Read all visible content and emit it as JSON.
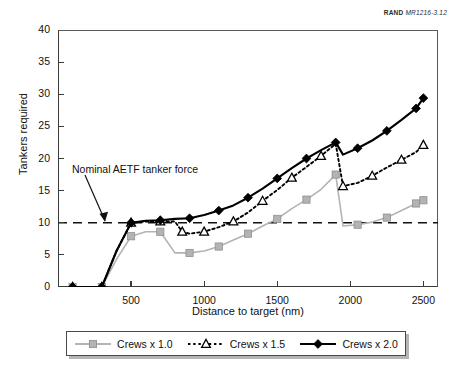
{
  "credit": {
    "rand": "RAND",
    "code": "MR1216-3.12"
  },
  "axes": {
    "ylabel": "Tankers required",
    "xlabel": "Distance to target (nm)",
    "yticks": [
      0,
      5,
      10,
      15,
      20,
      25,
      30,
      35,
      40
    ],
    "xticks": [
      500,
      1000,
      1500,
      2000,
      2500
    ]
  },
  "annotation": {
    "text": "Nominal AETF tanker force"
  },
  "legend": {
    "items": [
      {
        "label": "Crews x 1.0",
        "color": "#b3b3b3",
        "marker": "square",
        "style": "solid"
      },
      {
        "label": "Crews x 1.5",
        "color": "#000000",
        "marker": "triangle",
        "style": "dotted"
      },
      {
        "label": "Crews x 2.0",
        "color": "#000000",
        "marker": "diamond",
        "style": "solid"
      }
    ]
  },
  "chart_data": {
    "type": "line",
    "title": "",
    "xlabel": "Distance to target (nm)",
    "ylabel": "Tankers required",
    "xlim": [
      0,
      2600
    ],
    "ylim": [
      0,
      40
    ],
    "grid": false,
    "legend_position": "below",
    "reference_line": {
      "value": 10,
      "style": "dashed",
      "label": "Nominal AETF tanker force"
    },
    "series": [
      {
        "name": "Crews x 1.0",
        "color": "#b3b3b3",
        "marker": "square",
        "style": "solid",
        "points": [
          [
            100,
            0
          ],
          [
            200,
            0
          ],
          [
            300,
            0
          ],
          [
            400,
            4.3
          ],
          [
            500,
            7.9
          ],
          [
            600,
            8.6
          ],
          [
            700,
            8.6
          ],
          [
            800,
            5.3
          ],
          [
            900,
            5.3
          ],
          [
            1000,
            5.6
          ],
          [
            1100,
            6.3
          ],
          [
            1200,
            7.3
          ],
          [
            1300,
            8.3
          ],
          [
            1400,
            9.5
          ],
          [
            1500,
            10.6
          ],
          [
            1600,
            12.2
          ],
          [
            1700,
            13.6
          ],
          [
            1800,
            15.2
          ],
          [
            1900,
            17.5
          ],
          [
            1950,
            9.5
          ],
          [
            2050,
            9.7
          ],
          [
            2150,
            10.1
          ],
          [
            2250,
            10.8
          ],
          [
            2350,
            11.9
          ],
          [
            2450,
            13.0
          ],
          [
            2500,
            13.5
          ]
        ]
      },
      {
        "name": "Crews x 1.5",
        "color": "#000000",
        "marker": "triangle",
        "style": "dotted",
        "points": [
          [
            100,
            0
          ],
          [
            200,
            0
          ],
          [
            300,
            0
          ],
          [
            400,
            5.6
          ],
          [
            500,
            10.0
          ],
          [
            600,
            10.2
          ],
          [
            700,
            10.2
          ],
          [
            800,
            10.2
          ],
          [
            850,
            8.6
          ],
          [
            900,
            8.3
          ],
          [
            1000,
            8.6
          ],
          [
            1100,
            9.3
          ],
          [
            1200,
            10.2
          ],
          [
            1300,
            11.6
          ],
          [
            1400,
            13.4
          ],
          [
            1500,
            15.1
          ],
          [
            1600,
            17.0
          ],
          [
            1700,
            18.7
          ],
          [
            1800,
            20.4
          ],
          [
            1900,
            22.3
          ],
          [
            1950,
            15.7
          ],
          [
            2050,
            16.2
          ],
          [
            2150,
            17.3
          ],
          [
            2250,
            18.6
          ],
          [
            2350,
            19.8
          ],
          [
            2450,
            21.0
          ],
          [
            2500,
            22.1
          ]
        ]
      },
      {
        "name": "Crews x 2.0",
        "color": "#000000",
        "marker": "diamond",
        "style": "solid",
        "points": [
          [
            100,
            0
          ],
          [
            200,
            0
          ],
          [
            300,
            0
          ],
          [
            400,
            5.6
          ],
          [
            500,
            10.0
          ],
          [
            600,
            10.3
          ],
          [
            700,
            10.4
          ],
          [
            800,
            10.6
          ],
          [
            900,
            10.7
          ],
          [
            1000,
            11.2
          ],
          [
            1100,
            11.9
          ],
          [
            1200,
            12.7
          ],
          [
            1300,
            13.9
          ],
          [
            1400,
            15.3
          ],
          [
            1500,
            16.9
          ],
          [
            1600,
            18.5
          ],
          [
            1700,
            20.0
          ],
          [
            1800,
            21.3
          ],
          [
            1900,
            22.5
          ],
          [
            1950,
            20.6
          ],
          [
            2050,
            21.6
          ],
          [
            2150,
            22.8
          ],
          [
            2250,
            24.3
          ],
          [
            2350,
            26.0
          ],
          [
            2450,
            27.8
          ],
          [
            2500,
            29.4
          ]
        ]
      }
    ]
  }
}
